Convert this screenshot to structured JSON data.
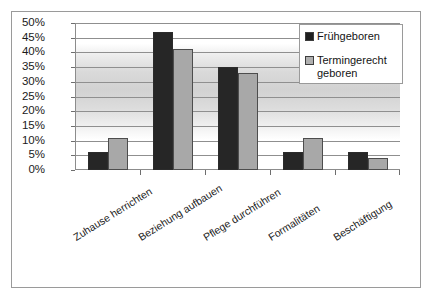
{
  "chart_data": {
    "type": "bar",
    "title": "",
    "xlabel": "",
    "ylabel": "",
    "ylim": [
      0,
      50
    ],
    "ytick_step": 5,
    "grid": true,
    "legend_position": "top-right",
    "categories": [
      "Zuhause herrichten",
      "Beziehung aufbauen",
      "Pflege durchführen",
      "Formalitäten",
      "Beschäftigung"
    ],
    "ytick_labels": [
      "0%",
      "5%",
      "10%",
      "15%",
      "20%",
      "25%",
      "30%",
      "35%",
      "40%",
      "45%",
      "50%"
    ],
    "ytick_values": [
      0,
      5,
      10,
      15,
      20,
      25,
      30,
      35,
      40,
      45,
      50
    ],
    "series": [
      {
        "name": "Frühgeboren",
        "color": "#262626",
        "values": [
          6,
          47,
          35,
          6,
          6
        ]
      },
      {
        "name": "Termingerecht geboren",
        "color": "#a8a8a8",
        "values": [
          11,
          41,
          33,
          11,
          4
        ]
      }
    ]
  },
  "legend": {
    "items": [
      {
        "label": "Frühgeboren",
        "swatch": "legend-swatch-dark"
      },
      {
        "label": "Termingerecht geboren",
        "swatch": "legend-swatch-light"
      }
    ]
  },
  "colors": {
    "series_0": "#262626",
    "series_1": "#a8a8a8",
    "frame_border": "#9a9a9a",
    "gridline": "#8f8f8f",
    "text": "#1a1a1a"
  }
}
